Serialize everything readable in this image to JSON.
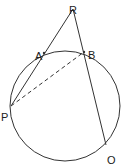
{
  "diagram": {
    "type": "geometry",
    "circle": {
      "cx": 65,
      "cy": 106,
      "r": 55
    },
    "points": [
      {
        "id": "R",
        "label": "R",
        "x": 73,
        "y": 9,
        "lx": 69,
        "ly": 6
      },
      {
        "id": "A",
        "label": "A",
        "x": 44,
        "y": 53,
        "lx": 35,
        "ly": 52
      },
      {
        "id": "B",
        "label": "B",
        "x": 84,
        "y": 52,
        "lx": 88,
        "ly": 51
      },
      {
        "id": "P",
        "label": "P",
        "x": 11,
        "y": 106,
        "lx": 1,
        "ly": 113
      },
      {
        "id": "Q",
        "label": "Q",
        "x": 106,
        "y": 145,
        "lx": 107,
        "ly": 156
      }
    ],
    "segments": [
      {
        "from": "R",
        "to": "P",
        "style": "solid"
      },
      {
        "from": "R",
        "to": "Q",
        "style": "solid"
      },
      {
        "from": "P",
        "to": "B",
        "style": "dashed"
      }
    ],
    "stroke_color": "#333333"
  }
}
